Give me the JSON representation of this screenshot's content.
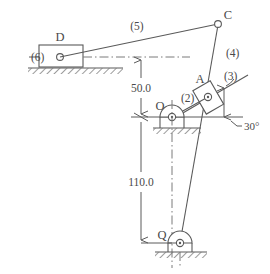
{
  "diagram": {
    "colors": {
      "line": "#5a5a5a",
      "line_dark": "#4a4a4a",
      "hatch": "#7a7a7a",
      "background": "#ffffff"
    },
    "joints": [
      {
        "id": "D",
        "label": "D",
        "x": 60,
        "y": 58,
        "type": "slider-pin"
      },
      {
        "id": "C",
        "label": "C",
        "x": 218,
        "y": 24,
        "type": "pin"
      },
      {
        "id": "A",
        "label": "A",
        "x": 208,
        "y": 97,
        "type": "slider-pin"
      },
      {
        "id": "O",
        "label": "O",
        "x": 172,
        "y": 117,
        "type": "fixed-pivot"
      },
      {
        "id": "Q",
        "label": "Q",
        "x": 180,
        "y": 243,
        "type": "fixed-pivot"
      }
    ],
    "links": [
      {
        "id": "link2",
        "label": "(2)",
        "from": "O",
        "to": "A",
        "label_x": 186,
        "label_y": 98
      },
      {
        "id": "link3",
        "label": "(3)",
        "from": "A",
        "to": "slide-30deg",
        "label_x": 227,
        "label_y": 79
      },
      {
        "id": "link4",
        "label": "(4)",
        "from": "C",
        "to": "Q",
        "label_x": 226,
        "label_y": 53
      },
      {
        "id": "link5",
        "label": "(5)",
        "from": "D",
        "to": "C",
        "label_x": 137,
        "label_y": 29
      },
      {
        "id": "link6",
        "label": "(6)",
        "from": "ground",
        "to": "D",
        "label_x": 38,
        "label_y": 60
      }
    ],
    "dimensions": [
      {
        "id": "dim-50",
        "value": "50.0",
        "x": 141,
        "y": 88,
        "from_y": 57,
        "to_y": 117
      },
      {
        "id": "dim-110",
        "value": "110.0",
        "x": 141,
        "y": 182,
        "from_y": 117,
        "to_y": 243
      }
    ],
    "angles": [
      {
        "id": "angle-30",
        "label": "30°",
        "value": 30,
        "x": 245,
        "y": 124,
        "vertex": "on-horizontal-right",
        "between": "horizontal reference and slide axis (3)"
      }
    ],
    "ground_supports": [
      {
        "id": "ground-D",
        "x": 28,
        "y": 68,
        "width": 95,
        "note": "horizontal slideway for slider (6)/D"
      },
      {
        "id": "ground-O",
        "x": 153,
        "y": 128,
        "width": 48,
        "note": "fixed pivot base at O"
      },
      {
        "id": "ground-Q",
        "x": 155,
        "y": 252,
        "width": 52,
        "note": "fixed pivot base at Q"
      }
    ],
    "centerlines": [
      {
        "id": "cl-horizontal-D",
        "note": "dash-dot horizontal through D to dimension line"
      },
      {
        "id": "cl-vertical-Q",
        "note": "dash-dot vertical through O and Q"
      },
      {
        "id": "cl-horizontal-O",
        "note": "horizontal reference line through O extending right to 30 degree vertex"
      }
    ]
  }
}
